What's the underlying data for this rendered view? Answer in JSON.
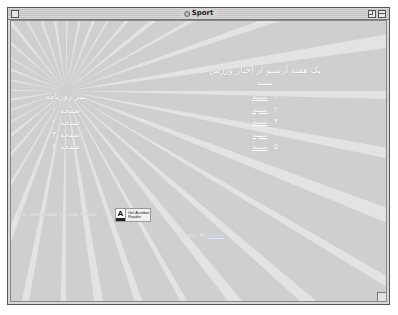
{
  "window": {
    "title": "Sport"
  },
  "archive": {
    "heading": "یک هفته آرشیو از اخبار ورزش",
    "day_header": "شنبه",
    "days": [
      {
        "num": "۱",
        "label": "شنبه"
      },
      {
        "num": "۲",
        "label": "شنبه"
      },
      {
        "num": "۳",
        "label": "شنبه"
      },
      {
        "num": "۴",
        "label": "شنبه"
      },
      {
        "num": "۵",
        "label": "شنبه"
      }
    ]
  },
  "newspaper": {
    "heading": "تیتر روزنامه",
    "pages": [
      {
        "label": "صفحه",
        "num": "۱"
      },
      {
        "label": "صفحه",
        "num": "۲"
      },
      {
        "label": "صفحه",
        "num": "۳"
      },
      {
        "label": "صفحه",
        "num": "۴"
      }
    ]
  },
  "acrobat": {
    "note": "You need Adobe Acrobat Reader",
    "badge_logo": "A",
    "badge_line1": "Get Acrobat",
    "badge_line2": "Reader"
  },
  "credit": {
    "prefix": "Design By",
    "author": "Moein"
  },
  "colors": {
    "background": "#cfcfcf",
    "rays": "#e6e6e6",
    "text": "#ffffff"
  }
}
